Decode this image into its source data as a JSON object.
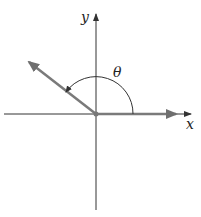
{
  "diagram": {
    "type": "angle-in-standard-position",
    "labels": {
      "x_axis": "x",
      "y_axis": "y",
      "angle": "θ"
    },
    "colors": {
      "axes": "#333333",
      "vector": "#7a7a7a",
      "arc": "#333333",
      "background": "#ffffff"
    }
  }
}
